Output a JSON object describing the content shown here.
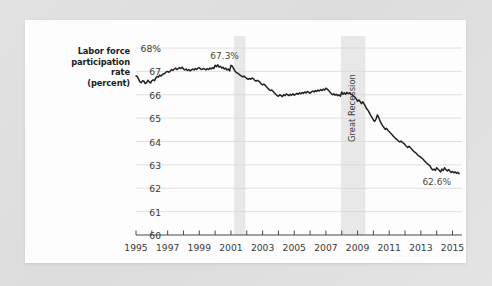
{
  "chart_data": {
    "type": "line",
    "title": "",
    "ylabel": "Labor force participation rate (percent)",
    "ylabel_lines": [
      "Labor force",
      "participation",
      "rate",
      "(percent)"
    ],
    "xlabel": "",
    "ylim": [
      60,
      68
    ],
    "xlim": [
      1995,
      2015.6
    ],
    "grid": true,
    "legend": "none",
    "line_color": "#222222",
    "band_color": "#e8e8e8",
    "background_color": "#fdfdfd",
    "page_background_color": "#dfdfdf",
    "yticks": [
      60,
      61,
      62,
      63,
      64,
      65,
      66,
      67,
      68
    ],
    "ytick_labels": [
      "60",
      "61",
      "62",
      "63",
      "64",
      "65",
      "66",
      "67",
      "68%"
    ],
    "xticks": [
      1995,
      1996,
      1997,
      1998,
      1999,
      2000,
      2001,
      2002,
      2003,
      2004,
      2005,
      2006,
      2007,
      2008,
      2009,
      2010,
      2011,
      2012,
      2013,
      2014,
      2015
    ],
    "xtick_labels": [
      "1995",
      "1997",
      "1999",
      "2001",
      "2003",
      "2005",
      "2007",
      "2009",
      "2011",
      "2013",
      "2015"
    ],
    "xtick_label_years": [
      1995,
      1997,
      1999,
      2001,
      2003,
      2005,
      2007,
      2009,
      2011,
      2013,
      2015
    ],
    "annotations": [
      {
        "text": "67.3%",
        "x": 2000.6,
        "y": 67.62,
        "name": "peak-annotation"
      },
      {
        "text": "62.6%",
        "x": 2014.0,
        "y": 62.22,
        "name": "trough-annotation"
      },
      {
        "text": "Great Recession",
        "x": 2008.6,
        "y": 64.0,
        "rotation": -90,
        "name": "great-recession-label"
      }
    ],
    "recession_bands": [
      {
        "name": "recession-2001",
        "start": 2001.2,
        "end": 2001.92
      },
      {
        "name": "great-recession",
        "start": 2007.95,
        "end": 2009.5
      }
    ],
    "series": [
      {
        "name": "Labor force participation rate",
        "x": [
          1995.0,
          1995.08,
          1995.17,
          1995.25,
          1995.33,
          1995.42,
          1995.5,
          1995.58,
          1995.67,
          1995.75,
          1995.83,
          1995.92,
          1996.0,
          1996.08,
          1996.17,
          1996.25,
          1996.33,
          1996.42,
          1996.5,
          1996.58,
          1996.67,
          1996.75,
          1996.83,
          1996.92,
          1997.0,
          1997.08,
          1997.17,
          1997.25,
          1997.33,
          1997.42,
          1997.5,
          1997.58,
          1997.67,
          1997.75,
          1997.83,
          1997.92,
          1998.0,
          1998.08,
          1998.17,
          1998.25,
          1998.33,
          1998.42,
          1998.5,
          1998.58,
          1998.67,
          1998.75,
          1998.83,
          1998.92,
          1999.0,
          1999.08,
          1999.17,
          1999.25,
          1999.33,
          1999.42,
          1999.5,
          1999.58,
          1999.67,
          1999.75,
          1999.83,
          1999.92,
          2000.0,
          2000.08,
          2000.17,
          2000.25,
          2000.33,
          2000.42,
          2000.5,
          2000.58,
          2000.67,
          2000.75,
          2000.83,
          2000.92,
          2001.0,
          2001.08,
          2001.17,
          2001.25,
          2001.33,
          2001.42,
          2001.5,
          2001.58,
          2001.67,
          2001.75,
          2001.83,
          2001.92,
          2002.0,
          2002.08,
          2002.17,
          2002.25,
          2002.33,
          2002.42,
          2002.5,
          2002.58,
          2002.67,
          2002.75,
          2002.83,
          2002.92,
          2003.0,
          2003.08,
          2003.17,
          2003.25,
          2003.33,
          2003.42,
          2003.5,
          2003.58,
          2003.67,
          2003.75,
          2003.83,
          2003.92,
          2004.0,
          2004.08,
          2004.17,
          2004.25,
          2004.33,
          2004.42,
          2004.5,
          2004.58,
          2004.67,
          2004.75,
          2004.83,
          2004.92,
          2005.0,
          2005.08,
          2005.17,
          2005.25,
          2005.33,
          2005.42,
          2005.5,
          2005.58,
          2005.67,
          2005.75,
          2005.83,
          2005.92,
          2006.0,
          2006.08,
          2006.17,
          2006.25,
          2006.33,
          2006.42,
          2006.5,
          2006.58,
          2006.67,
          2006.75,
          2006.83,
          2006.92,
          2007.0,
          2007.08,
          2007.17,
          2007.25,
          2007.33,
          2007.42,
          2007.5,
          2007.58,
          2007.67,
          2007.75,
          2007.83,
          2007.92,
          2008.0,
          2008.08,
          2008.17,
          2008.25,
          2008.33,
          2008.42,
          2008.5,
          2008.58,
          2008.67,
          2008.75,
          2008.83,
          2008.92,
          2009.0,
          2009.08,
          2009.17,
          2009.25,
          2009.33,
          2009.42,
          2009.5,
          2009.58,
          2009.67,
          2009.75,
          2009.83,
          2009.92,
          2010.0,
          2010.08,
          2010.17,
          2010.25,
          2010.33,
          2010.42,
          2010.5,
          2010.58,
          2010.67,
          2010.75,
          2010.83,
          2010.92,
          2011.0,
          2011.08,
          2011.17,
          2011.25,
          2011.33,
          2011.42,
          2011.5,
          2011.58,
          2011.67,
          2011.75,
          2011.83,
          2011.92,
          2012.0,
          2012.08,
          2012.17,
          2012.25,
          2012.33,
          2012.42,
          2012.5,
          2012.58,
          2012.67,
          2012.75,
          2012.83,
          2012.92,
          2013.0,
          2013.08,
          2013.17,
          2013.25,
          2013.33,
          2013.42,
          2013.5,
          2013.58,
          2013.67,
          2013.75,
          2013.83,
          2013.92,
          2014.0,
          2014.08,
          2014.17,
          2014.25,
          2014.33,
          2014.42,
          2014.5,
          2014.58,
          2014.67,
          2014.75,
          2014.83,
          2014.92,
          2015.0,
          2015.08,
          2015.17,
          2015.25,
          2015.33,
          2015.42
        ],
        "values": [
          66.8,
          66.78,
          66.66,
          66.55,
          66.52,
          66.6,
          66.58,
          66.48,
          66.52,
          66.62,
          66.56,
          66.5,
          66.6,
          66.64,
          66.6,
          66.72,
          66.78,
          66.76,
          66.84,
          66.8,
          66.86,
          66.9,
          66.92,
          66.98,
          67.0,
          66.96,
          67.02,
          67.08,
          67.04,
          67.1,
          67.14,
          67.08,
          67.12,
          67.16,
          67.12,
          67.18,
          67.1,
          67.06,
          67.1,
          67.04,
          67.08,
          67.02,
          67.06,
          67.1,
          67.06,
          67.12,
          67.08,
          67.14,
          67.16,
          67.1,
          67.08,
          67.12,
          67.1,
          67.06,
          67.12,
          67.08,
          67.14,
          67.1,
          67.16,
          67.12,
          67.26,
          67.2,
          67.28,
          67.18,
          67.22,
          67.14,
          67.18,
          67.1,
          67.14,
          67.06,
          67.1,
          67.02,
          67.26,
          67.22,
          67.12,
          67.02,
          66.96,
          66.92,
          66.88,
          66.84,
          66.8,
          66.76,
          66.8,
          66.74,
          66.7,
          66.66,
          66.7,
          66.66,
          66.72,
          66.68,
          66.62,
          66.58,
          66.62,
          66.58,
          66.54,
          66.46,
          66.42,
          66.46,
          66.4,
          66.34,
          66.28,
          66.22,
          66.18,
          66.2,
          66.14,
          66.08,
          66.02,
          65.96,
          65.94,
          66.0,
          65.96,
          65.92,
          66.0,
          65.96,
          66.04,
          66.0,
          65.96,
          66.02,
          65.98,
          66.04,
          65.98,
          66.02,
          66.06,
          66.02,
          66.08,
          66.04,
          66.1,
          66.06,
          66.12,
          66.08,
          66.14,
          66.1,
          66.06,
          66.12,
          66.16,
          66.12,
          66.18,
          66.14,
          66.2,
          66.16,
          66.22,
          66.18,
          66.24,
          66.2,
          66.28,
          66.24,
          66.18,
          66.12,
          66.06,
          66.0,
          66.04,
          65.98,
          66.02,
          65.96,
          66.0,
          65.94,
          66.12,
          66.02,
          66.08,
          66.02,
          66.1,
          66.04,
          66.08,
          66.02,
          66.0,
          65.94,
          65.9,
          65.82,
          65.72,
          65.78,
          65.7,
          65.62,
          65.7,
          65.6,
          65.5,
          65.4,
          65.32,
          65.22,
          65.12,
          65.02,
          64.92,
          64.86,
          64.96,
          65.14,
          65.04,
          64.88,
          64.78,
          64.68,
          64.6,
          64.52,
          64.56,
          64.48,
          64.42,
          64.36,
          64.3,
          64.24,
          64.18,
          64.12,
          64.08,
          64.02,
          63.98,
          64.02,
          63.96,
          63.92,
          63.86,
          63.8,
          63.74,
          63.8,
          63.74,
          63.68,
          63.62,
          63.56,
          63.52,
          63.46,
          63.4,
          63.36,
          63.32,
          63.28,
          63.22,
          63.16,
          63.1,
          63.04,
          63.0,
          62.96,
          62.84,
          62.78,
          62.82,
          62.76,
          62.88,
          62.82,
          62.76,
          62.7,
          62.82,
          62.76,
          62.88,
          62.8,
          62.74,
          62.8,
          62.74,
          62.68,
          62.72,
          62.66,
          62.7,
          62.64,
          62.68,
          62.62
        ]
      }
    ]
  }
}
